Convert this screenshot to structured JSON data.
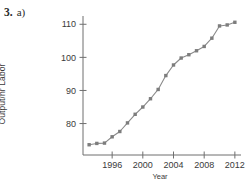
{
  "problem": {
    "number": "3.",
    "part": "a)"
  },
  "chart_data": {
    "type": "line",
    "title": "",
    "xlabel": "Year",
    "ylabel": "Output/hr Labor",
    "xlim": [
      1992.2,
      2012.8
    ],
    "ylim": [
      70.5,
      112.5
    ],
    "xticks": [
      1996,
      2000,
      2004,
      2008,
      2012
    ],
    "xtick_labels": [
      "1996",
      "2000",
      "2004",
      "2008",
      "2012"
    ],
    "yticks": [
      80,
      90,
      100,
      110
    ],
    "ytick_labels": [
      "80",
      "90",
      "100",
      "110"
    ],
    "grid": false,
    "legend": false,
    "marker": "square",
    "line_color": "#8a8a8a",
    "marker_color": "#7d7d7d",
    "axis_color": "#6f6f6f",
    "x": [
      1993,
      1994,
      1995,
      1996,
      1997,
      1998,
      1999,
      2000,
      2001,
      2002,
      2003,
      2004,
      2005,
      2006,
      2007,
      2008,
      2009,
      2010,
      2011,
      2012
    ],
    "values": [
      73.6,
      74.0,
      74.1,
      76.0,
      77.6,
      80.2,
      82.8,
      85.0,
      87.5,
      90.3,
      94.5,
      97.7,
      99.8,
      100.8,
      102.0,
      103.3,
      105.8,
      109.5,
      109.8,
      110.6
    ],
    "series": [
      {
        "name": "Output per hour of labor",
        "values": [
          73.6,
          74.0,
          74.1,
          76.0,
          77.6,
          80.2,
          82.8,
          85.0,
          87.5,
          90.3,
          94.5,
          97.7,
          99.8,
          100.8,
          102.0,
          103.3,
          105.8,
          109.5,
          109.8,
          110.6
        ]
      }
    ]
  }
}
